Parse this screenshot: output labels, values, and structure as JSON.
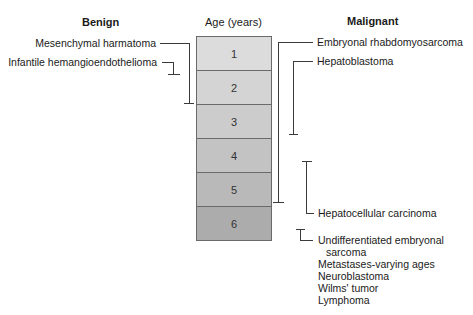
{
  "headers": {
    "benign": "Benign",
    "age": "Age (years)",
    "malignant": "Malignant"
  },
  "age_rows": [
    {
      "label": "1",
      "color": "#dcdcdc"
    },
    {
      "label": "2",
      "color": "#d4d4d4"
    },
    {
      "label": "3",
      "color": "#cccccc"
    },
    {
      "label": "4",
      "color": "#c3c3c3"
    },
    {
      "label": "5",
      "color": "#b9b9b9"
    },
    {
      "label": "6",
      "color": "#acacac"
    }
  ],
  "benign": [
    {
      "label": "Mesenchymal harmatoma",
      "age_range": "0-2"
    },
    {
      "label": "Infantile hemangioendothelioma",
      "age_range": "<1"
    }
  ],
  "malignant": [
    {
      "label": "Embryonal rhabdomyosarcoma",
      "age_range": "0-5"
    },
    {
      "label": "Hepatoblastoma",
      "age_range": "0-3"
    },
    {
      "label": "Hepatocellular carcinoma",
      "age_range": "4-5"
    },
    {
      "label": "Undifferentiated embryonal",
      "label_line2": "sarcoma",
      "age_range": "6+"
    }
  ],
  "malignant_other": [
    "Metastases-varying ages",
    "Neuroblastoma",
    "Wilms' tumor",
    "Lymphoma"
  ],
  "line_color": "#3a3a3a"
}
